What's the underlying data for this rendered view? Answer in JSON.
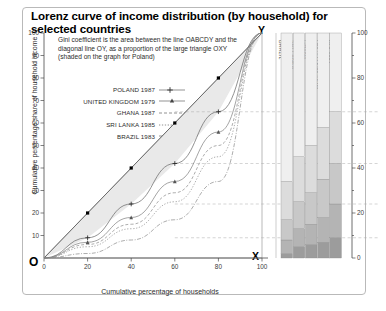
{
  "title": "Lorenz curve of income distribution (by household) for selected countries",
  "note": "Gini coefficient is the area between the line OABCDY and the diagonal line OY, as a proportion of the large triangle OXY (shaded on the graph for Poland)",
  "legend": [
    {
      "label": "POLAND 1987",
      "key": "plus-marker-line"
    },
    {
      "label": "UNITED KINGDOM 1979",
      "key": "triangle-marker-line"
    },
    {
      "label": "GHANA 1987",
      "key": "dashed-line"
    },
    {
      "label": "SRI LANKA 1985",
      "key": "dotted-line"
    },
    {
      "label": "BRAZIL 1983",
      "key": "dash-dot-line"
    }
  ],
  "axes": {
    "x_label": "Cumulative percentage of households",
    "y_label": "Cumulative percentage share of household income",
    "x_ticks": [
      "0",
      "20",
      "40",
      "60",
      "80",
      "100"
    ],
    "y_ticks": [
      "10",
      "20",
      "30",
      "40",
      "50",
      "60",
      "70",
      "80",
      "90",
      "100"
    ],
    "right_ticks": [
      "0",
      "20",
      "40",
      "60",
      "80",
      "100"
    ]
  },
  "vertices": {
    "origin": "O",
    "top": "Y",
    "right": "X"
  },
  "curve_points": [
    {
      "label": "A",
      "x": 20,
      "y": 9
    },
    {
      "label": "B",
      "x": 40,
      "y": 24
    },
    {
      "label": "C",
      "x": 60,
      "y": 42
    },
    {
      "label": "D",
      "x": 80,
      "y": 65
    }
  ],
  "bar_labels": [
    "BRAZIL",
    "SRI LANKA",
    "GHANA",
    "UNITED KINGDOM",
    "POLAND"
  ],
  "colors": {
    "frame": "#b9b9b9",
    "axis": "#4a4a4a",
    "shade": "#e9e9e9",
    "text": "#2b2b2b"
  },
  "chart_data": {
    "type": "line",
    "title": "Lorenz curve of income distribution (by household) for selected countries",
    "xlabel": "Cumulative percentage of households",
    "ylabel": "Cumulative percentage share of household income",
    "xlim": [
      0,
      100
    ],
    "ylim": [
      0,
      100
    ],
    "grid": false,
    "legend_position": "upper-left",
    "x": [
      0,
      20,
      40,
      60,
      80,
      100
    ],
    "series": [
      {
        "name": "POLAND 1987",
        "values": [
          0,
          9,
          24,
          42,
          65,
          100
        ],
        "style": "solid-plus"
      },
      {
        "name": "UNITED KINGDOM 1979",
        "values": [
          0,
          7,
          18,
          34,
          56,
          100
        ],
        "style": "solid-triangle"
      },
      {
        "name": "GHANA 1987",
        "values": [
          0,
          6,
          15,
          29,
          50,
          100
        ],
        "style": "dashed"
      },
      {
        "name": "SRI LANKA 1985",
        "values": [
          0,
          5,
          13,
          25,
          45,
          100
        ],
        "style": "dotted"
      },
      {
        "name": "BRAZIL 1983",
        "values": [
          0,
          2,
          8,
          17,
          34,
          100
        ],
        "style": "dash-dot"
      },
      {
        "name": "Line of equality OY",
        "values": [
          0,
          20,
          40,
          60,
          80,
          100
        ],
        "style": "diagonal"
      }
    ],
    "annotations": [
      {
        "text": "O",
        "x": 0,
        "y": 0
      },
      {
        "text": "X",
        "x": 100,
        "y": 0
      },
      {
        "text": "Y",
        "x": 100,
        "y": 100
      },
      {
        "text": "A",
        "x": 20,
        "y": 9
      },
      {
        "text": "B",
        "x": 40,
        "y": 24
      },
      {
        "text": "C",
        "x": 60,
        "y": 42
      },
      {
        "text": "D",
        "x": 80,
        "y": 65
      }
    ],
    "secondary_chart": {
      "type": "bar",
      "stacked": true,
      "ylim": [
        0,
        100
      ],
      "categories": [
        "BRAZIL",
        "SRI LANKA",
        "GHANA",
        "UNITED KINGDOM",
        "POLAND"
      ],
      "quintile_shares": [
        {
          "name": "BRAZIL",
          "values": [
            2,
            6,
            9,
            17,
            66
          ]
        },
        {
          "name": "SRI LANKA",
          "values": [
            5,
            8,
            12,
            20,
            55
          ]
        },
        {
          "name": "GHANA",
          "values": [
            6,
            9,
            14,
            21,
            50
          ]
        },
        {
          "name": "UNITED KINGDOM",
          "values": [
            7,
            11,
            17,
            23,
            42
          ]
        },
        {
          "name": "POLAND",
          "values": [
            9,
            15,
            18,
            23,
            35
          ]
        }
      ]
    }
  }
}
